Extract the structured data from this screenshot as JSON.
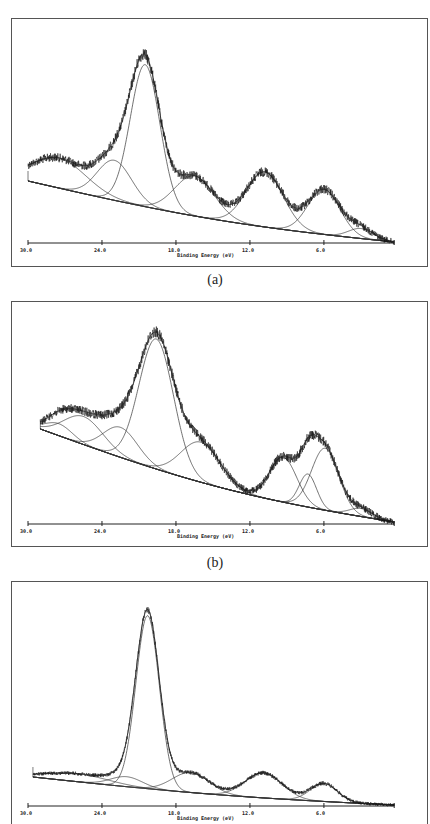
{
  "header": {
    "text": ""
  },
  "chart_data": [
    {
      "type": "line",
      "panel": "(a)",
      "title": "",
      "xlabel": "Binding Energy (eV)",
      "ylabel": "",
      "x_tick_labels": [
        "30.0",
        "24.0",
        "18.0",
        "12.0",
        "6.0"
      ],
      "x_ticks": [
        30.0,
        24.0,
        18.0,
        12.0,
        6.0
      ],
      "xlim": [
        30.0,
        0.3
      ],
      "x_reversed": true,
      "grid": false,
      "legend": null,
      "series": [
        {
          "name": "measured spectrum (noisy)",
          "style": "noisy"
        },
        {
          "name": "fitted envelope",
          "style": "fit"
        },
        {
          "name": "background",
          "style": "baseline"
        }
      ],
      "baseline": {
        "start_eV": 30.0,
        "start_px": 181,
        "end_eV": 0.3,
        "end_px": 242
      },
      "components": [
        {
          "center_eV": 27.5,
          "height_px": 30,
          "sigma_eV": 2.2
        },
        {
          "center_eV": 23.0,
          "height_px": 40,
          "sigma_eV": 1.4
        },
        {
          "center_eV": 20.5,
          "height_px": 142,
          "sigma_eV": 1.2
        },
        {
          "center_eV": 16.5,
          "height_px": 40,
          "sigma_eV": 1.6
        },
        {
          "center_eV": 10.8,
          "height_px": 55,
          "sigma_eV": 1.5
        },
        {
          "center_eV": 6.0,
          "height_px": 45,
          "sigma_eV": 1.3
        },
        {
          "center_eV": 3.0,
          "height_px": 10,
          "sigma_eV": 1.0
        }
      ],
      "noise_px": 5,
      "main_peak_eV": 20.5
    },
    {
      "type": "line",
      "panel": "(b)",
      "title": "",
      "xlabel": "Binding Energy (eV)",
      "ylabel": "",
      "x_tick_labels": [
        "30.0",
        "24.0",
        "18.0",
        "12.0",
        "6.0"
      ],
      "x_ticks": [
        30.0,
        24.0,
        18.0,
        12.0,
        6.0
      ],
      "xlim": [
        30.0,
        0.3
      ],
      "x_reversed": true,
      "grid": false,
      "legend": null,
      "series": [
        {
          "name": "measured spectrum (noisy)",
          "style": "noisy"
        },
        {
          "name": "fitted envelope",
          "style": "fit"
        },
        {
          "name": "background",
          "style": "baseline"
        }
      ],
      "baseline": {
        "start_eV": 29.0,
        "start_px": 429,
        "end_eV": 0.3,
        "end_px": 522
      },
      "components": [
        {
          "center_eV": 27.5,
          "height_px": 12,
          "sigma_eV": 1.1
        },
        {
          "center_eV": 25.5,
          "height_px": 28,
          "sigma_eV": 1.6
        },
        {
          "center_eV": 22.5,
          "height_px": 30,
          "sigma_eV": 1.4
        },
        {
          "center_eV": 19.6,
          "height_px": 130,
          "sigma_eV": 1.4
        },
        {
          "center_eV": 16.0,
          "height_px": 40,
          "sigma_eV": 1.6
        },
        {
          "center_eV": 9.3,
          "height_px": 45,
          "sigma_eV": 1.1
        },
        {
          "center_eV": 7.3,
          "height_px": 33,
          "sigma_eV": 0.7
        },
        {
          "center_eV": 5.9,
          "height_px": 62,
          "sigma_eV": 1.1
        },
        {
          "center_eV": 3.0,
          "height_px": 8,
          "sigma_eV": 0.9
        }
      ],
      "noise_px": 5,
      "main_peak_eV": 19.6
    },
    {
      "type": "line",
      "panel": "(c)",
      "title": "",
      "xlabel": "Binding Energy (eV)",
      "ylabel": "",
      "x_tick_labels": [
        "30.0",
        "24.0",
        "18.0",
        "12.0",
        "6.0"
      ],
      "x_ticks": [
        30.0,
        24.0,
        18.0,
        12.0,
        6.0
      ],
      "xlim": [
        30.0,
        0.3
      ],
      "x_reversed": true,
      "grid": false,
      "legend": null,
      "series": [
        {
          "name": "measured spectrum (noisy)",
          "style": "noisy"
        },
        {
          "name": "fitted envelope",
          "style": "fit"
        },
        {
          "name": "background",
          "style": "baseline"
        }
      ],
      "baseline": {
        "start_eV": 29.6,
        "start_px": 777,
        "end_eV": 0.3,
        "end_px": 805
      },
      "components": [
        {
          "center_eV": 26.0,
          "height_px": 8,
          "sigma_eV": 2.5
        },
        {
          "center_eV": 22.0,
          "height_px": 10,
          "sigma_eV": 1.3
        },
        {
          "center_eV": 20.3,
          "height_px": 173,
          "sigma_eV": 0.95
        },
        {
          "center_eV": 16.8,
          "height_px": 20,
          "sigma_eV": 1.5
        },
        {
          "center_eV": 10.9,
          "height_px": 25,
          "sigma_eV": 1.5
        },
        {
          "center_eV": 6.0,
          "height_px": 18,
          "sigma_eV": 1.1
        }
      ],
      "noise_px": 2.5,
      "main_peak_eV": 20.3
    }
  ],
  "captions": {
    "a": "(a)",
    "b": "(b)",
    "c": "(c)"
  },
  "panels": [
    {
      "frame": {
        "x": 11,
        "y": 18,
        "w": 416,
        "h": 248
      },
      "axis_y": 243,
      "caption_y": 273
    },
    {
      "frame": {
        "x": 11,
        "y": 301,
        "w": 416,
        "h": 245
      },
      "axis_y": 524,
      "caption_y": 556
    },
    {
      "frame": {
        "x": 11,
        "y": 581,
        "w": 416,
        "h": 250
      },
      "axis_y": 806,
      "caption_y": null
    }
  ]
}
